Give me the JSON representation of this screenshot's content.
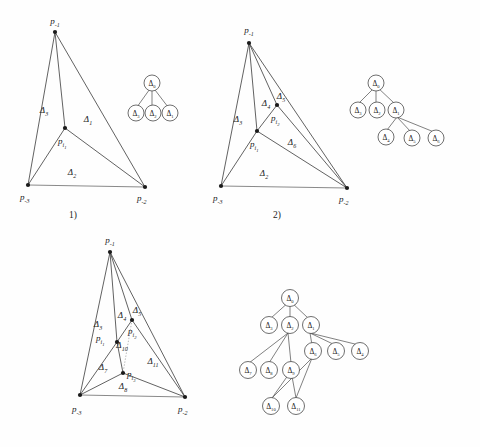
{
  "figure": {
    "background_color": "#fefefe",
    "line_color": "#3a3a3a",
    "vertex_color": "#1a1a1a"
  },
  "panels": [
    {
      "id": "panel-1",
      "caption": "1)",
      "points": [
        {
          "name": "p-minus-1",
          "base": "p",
          "sub": "-1"
        },
        {
          "name": "p-minus-2",
          "base": "p",
          "sub": "-2"
        },
        {
          "name": "p-minus-3",
          "base": "p",
          "sub": "-3"
        },
        {
          "name": "p-i-1",
          "base": "p",
          "sub": "i",
          "subsub": "1"
        }
      ],
      "triangle_labels": [
        {
          "name": "delta-3",
          "base": "Δ",
          "sub": "3"
        },
        {
          "name": "delta-1",
          "base": "Δ",
          "sub": "1"
        },
        {
          "name": "delta-2",
          "base": "Δ",
          "sub": "2"
        }
      ],
      "tree": {
        "root": {
          "base": "Δ",
          "sub": "0"
        },
        "children": [
          {
            "base": "Δ",
            "sub": "3"
          },
          {
            "base": "Δ",
            "sub": "2"
          },
          {
            "base": "Δ",
            "sub": "1"
          }
        ]
      }
    },
    {
      "id": "panel-2",
      "caption": "2)",
      "points": [
        {
          "name": "p-minus-1",
          "base": "p",
          "sub": "-1"
        },
        {
          "name": "p-minus-2",
          "base": "p",
          "sub": "-2"
        },
        {
          "name": "p-minus-3",
          "base": "p",
          "sub": "-3"
        },
        {
          "name": "p-i-1",
          "base": "p",
          "sub": "i",
          "subsub": "1"
        },
        {
          "name": "p-i-2",
          "base": "p",
          "sub": "i",
          "subsub": "2"
        }
      ],
      "triangle_labels": [
        {
          "name": "delta-3",
          "base": "Δ",
          "sub": "3"
        },
        {
          "name": "delta-4",
          "base": "Δ",
          "sub": "4"
        },
        {
          "name": "delta-5",
          "base": "Δ",
          "sub": "5"
        },
        {
          "name": "delta-6",
          "base": "Δ",
          "sub": "6"
        },
        {
          "name": "delta-2",
          "base": "Δ",
          "sub": "2"
        }
      ],
      "tree": {
        "root": {
          "base": "Δ",
          "sub": "0"
        },
        "level1": [
          {
            "base": "Δ",
            "sub": "3"
          },
          {
            "base": "Δ",
            "sub": "2"
          },
          {
            "base": "Δ",
            "sub": "1"
          }
        ],
        "level2": [
          {
            "base": "Δ",
            "sub": "4"
          },
          {
            "base": "Δ",
            "sub": "5"
          },
          {
            "base": "Δ",
            "sub": "6"
          }
        ]
      }
    },
    {
      "id": "panel-3",
      "caption": "",
      "points": [
        {
          "name": "p-minus-1",
          "base": "p",
          "sub": "-1"
        },
        {
          "name": "p-minus-2",
          "base": "p",
          "sub": "-2"
        },
        {
          "name": "p-minus-3",
          "base": "p",
          "sub": "-3"
        },
        {
          "name": "p-i-1",
          "base": "p",
          "sub": "i",
          "subsub": "1"
        },
        {
          "name": "p-i-2",
          "base": "p",
          "sub": "i",
          "subsub": "2"
        },
        {
          "name": "p-i-3",
          "base": "p",
          "sub": "i",
          "subsub": "3"
        }
      ],
      "triangle_labels": [
        {
          "name": "delta-3",
          "base": "Δ",
          "sub": "3"
        },
        {
          "name": "delta-4",
          "base": "Δ",
          "sub": "4"
        },
        {
          "name": "delta-5",
          "base": "Δ",
          "sub": "5"
        },
        {
          "name": "delta-10",
          "base": "Δ",
          "sub": "10"
        },
        {
          "name": "delta-11",
          "base": "Δ",
          "sub": "11"
        },
        {
          "name": "delta-7",
          "base": "Δ",
          "sub": "7"
        },
        {
          "name": "delta-8",
          "base": "Δ",
          "sub": "8"
        }
      ],
      "tree": {
        "root": {
          "base": "Δ",
          "sub": "0"
        },
        "level1": [
          {
            "base": "Δ",
            "sub": "3"
          },
          {
            "base": "Δ",
            "sub": "2"
          },
          {
            "base": "Δ",
            "sub": "1"
          }
        ],
        "level2": [
          {
            "base": "Δ",
            "sub": "7"
          },
          {
            "base": "Δ",
            "sub": "8"
          },
          {
            "base": "Δ",
            "sub": "9"
          },
          {
            "base": "Δ",
            "sub": "6"
          },
          {
            "base": "Δ",
            "sub": "5"
          },
          {
            "base": "Δ",
            "sub": "4"
          }
        ],
        "level3": [
          {
            "base": "Δ",
            "sub": "10"
          },
          {
            "base": "Δ",
            "sub": "11"
          }
        ]
      }
    }
  ]
}
